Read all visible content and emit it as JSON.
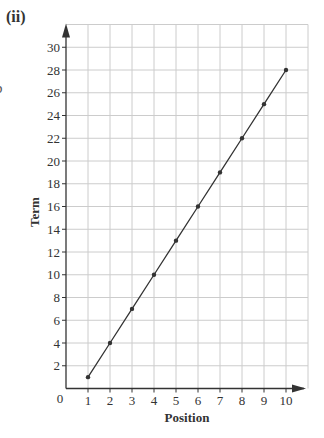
{
  "part_label": "(ii)",
  "edge_fragment": "b",
  "chart_data": {
    "type": "line",
    "title": "",
    "xlabel": "Position",
    "ylabel": "Term",
    "x": [
      1,
      2,
      3,
      4,
      5,
      6,
      7,
      8,
      9,
      10
    ],
    "series": [
      {
        "name": "Term",
        "values": [
          1,
          4,
          7,
          10,
          13,
          16,
          19,
          22,
          25,
          28
        ]
      }
    ],
    "xticks": [
      1,
      2,
      3,
      4,
      5,
      6,
      7,
      8,
      9,
      10
    ],
    "yticks": [
      2,
      4,
      6,
      8,
      10,
      12,
      14,
      16,
      18,
      20,
      22,
      24,
      26,
      28,
      30
    ],
    "origin_label": "0",
    "xlim": [
      0,
      11
    ],
    "ylim": [
      0,
      32
    ],
    "grid": true,
    "legend": "none",
    "colors": {
      "line": "#333333",
      "grid": "#cccccc",
      "axis": "#333333",
      "text": "#333333"
    }
  }
}
